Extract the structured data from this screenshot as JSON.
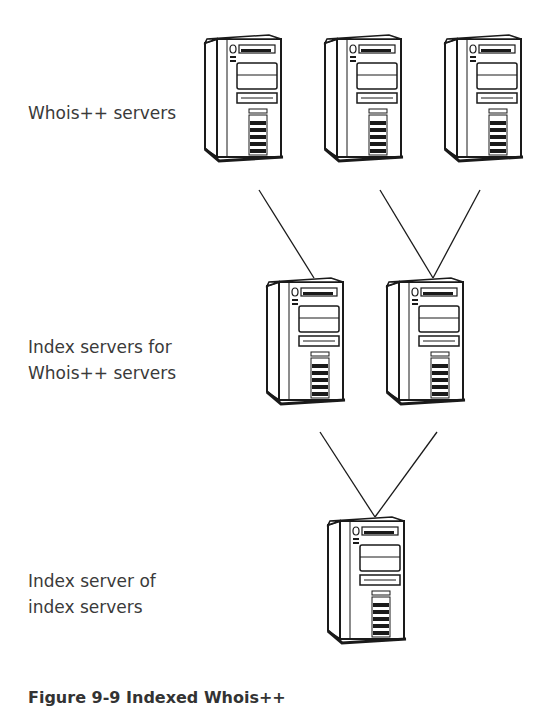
{
  "labels": {
    "tier1": "Whois++ servers",
    "tier2_line1": "Index servers for",
    "tier2_line2": "Whois++ servers",
    "tier3_line1": "Index server of",
    "tier3_line2": "index servers"
  },
  "caption": "Figure 9-9  Indexed Whois++",
  "tiers": [
    {
      "name": "whois-servers",
      "count": 3
    },
    {
      "name": "index-servers",
      "count": 2
    },
    {
      "name": "index-of-index-server",
      "count": 1
    }
  ],
  "colors": {
    "stroke": "#1a1a1a",
    "fill": "#ffffff",
    "text": "#3a3a3a"
  }
}
